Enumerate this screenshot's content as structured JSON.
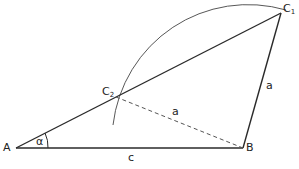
{
  "diagram": {
    "type": "geometric-construction",
    "points": {
      "A": {
        "label": "A",
        "x": 16,
        "y": 148
      },
      "B": {
        "label": "B",
        "x": 243,
        "y": 148
      },
      "C1": {
        "label": "C",
        "sub": "1",
        "x": 281,
        "y": 13
      },
      "C2": {
        "label": "C",
        "sub": "2",
        "x": 116,
        "y": 115
      }
    },
    "segments": [
      {
        "from": "A",
        "to": "B",
        "style": "solid",
        "label": "c"
      },
      {
        "from": "A",
        "to": "C1",
        "style": "solid"
      },
      {
        "from": "B",
        "to": "C1",
        "style": "solid",
        "label": "a"
      },
      {
        "from": "B",
        "to": "C2",
        "style": "dashed",
        "label": "a"
      }
    ],
    "arc": {
      "center": "B",
      "from": "C2",
      "to": "C1"
    },
    "angle": {
      "vertex": "A",
      "label": "α"
    },
    "labels": {
      "A": "A",
      "B": "B",
      "C": "C",
      "c1_sub": "1",
      "c2_sub": "2",
      "side_c": "c",
      "side_a_solid": "a",
      "side_a_dashed": "a",
      "alpha": "α"
    },
    "colors": {
      "line": "#2a2a2a",
      "background": "#ffffff"
    }
  }
}
